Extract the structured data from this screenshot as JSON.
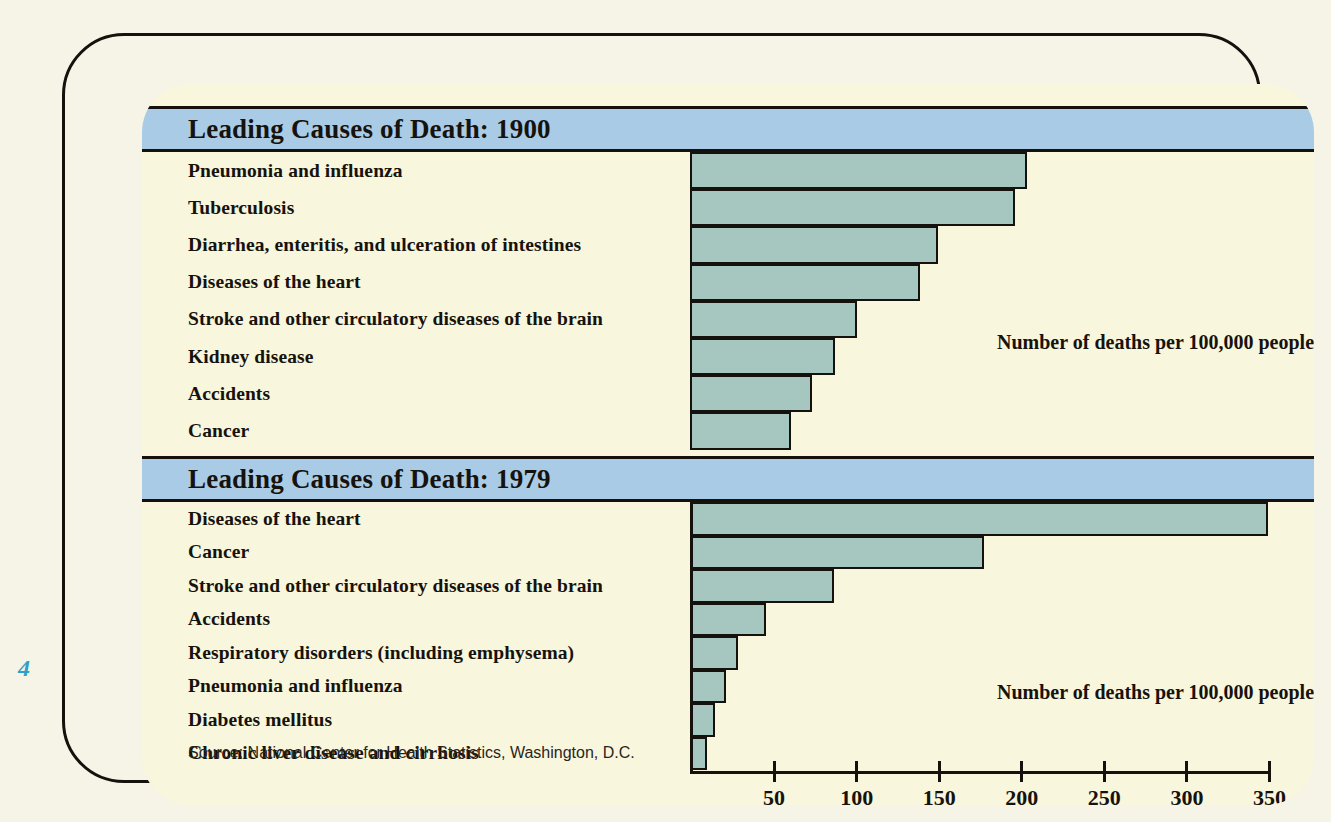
{
  "page_number": "4",
  "panels": [
    {
      "id": "1900",
      "title": "Leading Causes of Death: 1900",
      "annotation": "Number of deaths per 100,000 people",
      "rows": [
        {
          "label": "Pneumonia and influenza",
          "value": 204
        },
        {
          "label": "Tuberculosis",
          "value": 197
        },
        {
          "label": "Diarrhea, enteritis, and ulceration of intestines",
          "value": 150
        },
        {
          "label": "Diseases of the heart",
          "value": 139
        },
        {
          "label": "Stroke and other circulatory diseases of the brain",
          "value": 101
        },
        {
          "label": "Kidney disease",
          "value": 88
        },
        {
          "label": "Accidents",
          "value": 74
        },
        {
          "label": "Cancer",
          "value": 61
        }
      ]
    },
    {
      "id": "1979",
      "title": "Leading Causes of Death: 1979",
      "annotation": "Number of deaths per 100,000 people",
      "rows": [
        {
          "label": "Diseases of the heart",
          "value": 350
        },
        {
          "label": "Cancer",
          "value": 178
        },
        {
          "label": "Stroke and other circulatory diseases of the brain",
          "value": 87
        },
        {
          "label": "Accidents",
          "value": 46
        },
        {
          "label": "Respiratory disorders (including emphysema)",
          "value": 29
        },
        {
          "label": "Pneumonia and influenza",
          "value": 22
        },
        {
          "label": "Diabetes mellitus",
          "value": 15
        },
        {
          "label": "Chronic liver disease and cirrhosis",
          "value": 10
        }
      ]
    }
  ],
  "axis": {
    "ticks": [
      50,
      100,
      150,
      200,
      250,
      300,
      350
    ],
    "min": 0,
    "max": 350,
    "tick_labels": [
      "50",
      "100",
      "150",
      "200",
      "250",
      "300",
      "350"
    ]
  },
  "source_note": "Source: National Center for Health Statistics, Washington, D.C.",
  "colors": {
    "title_band": "#a9cbe6",
    "panel_background": "#f8f6dc",
    "bar_fill": "#a6c6c0",
    "outline": "#15110c",
    "page_number": "#2f9fc9",
    "page_background": "#f6f3e7"
  },
  "chart_data": {
    "type": "bar",
    "orientation": "horizontal",
    "xlabel": "Number of deaths per 100,000 people",
    "ylabel": "",
    "xlim": [
      0,
      350
    ],
    "grid": false,
    "legend": "none",
    "panels": [
      {
        "title": "Leading Causes of Death: 1900",
        "categories": [
          "Pneumonia and influenza",
          "Tuberculosis",
          "Diarrhea, enteritis, and ulceration of intestines",
          "Diseases of the heart",
          "Stroke and other circulatory diseases of the brain",
          "Kidney disease",
          "Accidents",
          "Cancer"
        ],
        "values": [
          204,
          197,
          150,
          139,
          101,
          88,
          74,
          61
        ]
      },
      {
        "title": "Leading Causes of Death: 1979",
        "categories": [
          "Diseases of the heart",
          "Cancer",
          "Stroke and other circulatory diseases of the brain",
          "Accidents",
          "Respiratory disorders (including emphysema)",
          "Pneumonia and influenza",
          "Diabetes mellitus",
          "Chronic liver disease and cirrhosis"
        ],
        "values": [
          350,
          178,
          87,
          46,
          29,
          22,
          15,
          10
        ]
      }
    ],
    "xticks": [
      50,
      100,
      150,
      200,
      250,
      300,
      350
    ],
    "source": "Source: National Center for Health Statistics, Washington, D.C."
  }
}
